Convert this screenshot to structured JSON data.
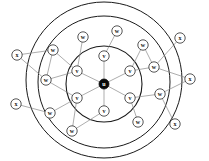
{
  "diagram": {
    "background_color": "#ffffff",
    "rings": [
      {
        "name": "inner-ring",
        "cx": 104,
        "cy": 84,
        "r": 38,
        "stroke": "#1a1a1a",
        "stroke_width": 1.1
      },
      {
        "name": "middle-ring",
        "cx": 104,
        "cy": 82,
        "r": 66,
        "stroke": "#1a1a1a",
        "stroke_width": 1.0
      },
      {
        "name": "outer-ring",
        "cx": 104,
        "cy": 80,
        "r": 78,
        "stroke": "#1a1a1a",
        "stroke_width": 1.0
      }
    ],
    "node_radius": 5.2,
    "center_radius": 5.0,
    "nodes": [
      {
        "id": "u",
        "label": "u",
        "x": 104,
        "y": 84,
        "layer": "center",
        "filled": true
      },
      {
        "id": "v1",
        "label": "v",
        "x": 104,
        "y": 56,
        "layer": "inner",
        "filled": false
      },
      {
        "id": "v2",
        "label": "v",
        "x": 130,
        "y": 71,
        "layer": "inner",
        "filled": false
      },
      {
        "id": "v3",
        "label": "v",
        "x": 130,
        "y": 98,
        "layer": "inner",
        "filled": false
      },
      {
        "id": "v4",
        "label": "v",
        "x": 104,
        "y": 111,
        "layer": "inner",
        "filled": false
      },
      {
        "id": "v5",
        "label": "v",
        "x": 77,
        "y": 98,
        "layer": "inner",
        "filled": false
      },
      {
        "id": "v6",
        "label": "v",
        "x": 77,
        "y": 71,
        "layer": "inner",
        "filled": false
      },
      {
        "id": "w1",
        "label": "w",
        "x": 83,
        "y": 37,
        "layer": "middle",
        "filled": false
      },
      {
        "id": "w2",
        "label": "w",
        "x": 117,
        "y": 31,
        "layer": "middle",
        "filled": false
      },
      {
        "id": "w3",
        "label": "w",
        "x": 143,
        "y": 45,
        "layer": "middle",
        "filled": false
      },
      {
        "id": "w4",
        "label": "w",
        "x": 154,
        "y": 67,
        "layer": "middle",
        "filled": false
      },
      {
        "id": "w5",
        "label": "w",
        "x": 160,
        "y": 94,
        "layer": "middle",
        "filled": false
      },
      {
        "id": "w6",
        "label": "w",
        "x": 138,
        "y": 122,
        "layer": "middle",
        "filled": false
      },
      {
        "id": "w7",
        "label": "w",
        "x": 72,
        "y": 131,
        "layer": "middle",
        "filled": false
      },
      {
        "id": "w8",
        "label": "w",
        "x": 50,
        "y": 113,
        "layer": "middle",
        "filled": false
      },
      {
        "id": "w9",
        "label": "w",
        "x": 46,
        "y": 80,
        "layer": "middle",
        "filled": false
      },
      {
        "id": "w10",
        "label": "w",
        "x": 53,
        "y": 50,
        "layer": "middle",
        "filled": false
      },
      {
        "id": "x1",
        "label": "x",
        "x": 17,
        "y": 55,
        "layer": "outer",
        "filled": false
      },
      {
        "id": "x2",
        "label": "x",
        "x": 16,
        "y": 104,
        "layer": "outer",
        "filled": false
      },
      {
        "id": "x3",
        "label": "x",
        "x": 180,
        "y": 38,
        "layer": "outer",
        "filled": false
      },
      {
        "id": "x4",
        "label": "x",
        "x": 190,
        "y": 79,
        "layer": "outer",
        "filled": false
      },
      {
        "id": "x5",
        "label": "x",
        "x": 175,
        "y": 124,
        "layer": "outer",
        "filled": false
      }
    ],
    "edges": [
      {
        "from": "u",
        "to": "v1"
      },
      {
        "from": "u",
        "to": "v2"
      },
      {
        "from": "u",
        "to": "v3"
      },
      {
        "from": "u",
        "to": "v4"
      },
      {
        "from": "u",
        "to": "v5"
      },
      {
        "from": "u",
        "to": "v6"
      },
      {
        "from": "v1",
        "to": "w2"
      },
      {
        "from": "v6",
        "to": "w1"
      },
      {
        "from": "v6",
        "to": "w10"
      },
      {
        "from": "v6",
        "to": "w9"
      },
      {
        "from": "v2",
        "to": "w3"
      },
      {
        "from": "v2",
        "to": "w4"
      },
      {
        "from": "v3",
        "to": "w5"
      },
      {
        "from": "v3",
        "to": "w6"
      },
      {
        "from": "v4",
        "to": "w7"
      },
      {
        "from": "v5",
        "to": "w7"
      },
      {
        "from": "v5",
        "to": "w8"
      },
      {
        "from": "v5",
        "to": "w9"
      },
      {
        "from": "w10",
        "to": "x1"
      },
      {
        "from": "w9",
        "to": "x1"
      },
      {
        "from": "w8",
        "to": "x2"
      },
      {
        "from": "w4",
        "to": "x3"
      },
      {
        "from": "w4",
        "to": "x4"
      },
      {
        "from": "w5",
        "to": "x4"
      },
      {
        "from": "w5",
        "to": "x5"
      },
      {
        "from": "w3",
        "to": "w4"
      },
      {
        "from": "w10",
        "to": "w9"
      }
    ]
  }
}
